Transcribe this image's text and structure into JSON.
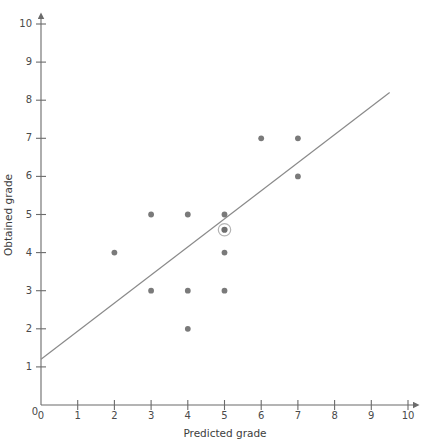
{
  "chart_data": {
    "type": "scatter",
    "title": "",
    "xlabel": "Predicted grade",
    "ylabel": "Obtained grade",
    "xlim": [
      0,
      10
    ],
    "ylim": [
      0,
      10
    ],
    "xticks": [
      0,
      1,
      2,
      3,
      4,
      5,
      6,
      7,
      8,
      9,
      10
    ],
    "yticks": [
      0,
      1,
      2,
      3,
      4,
      5,
      6,
      7,
      8,
      9,
      10
    ],
    "xtick_labels": [
      "0",
      "1",
      "2",
      "3",
      "4",
      "5",
      "6",
      "7",
      "8",
      "9",
      "10"
    ],
    "ytick_labels": [
      "0",
      "1",
      "2",
      "3",
      "4",
      "5",
      "6",
      "7",
      "8",
      "9",
      "10"
    ],
    "grid": false,
    "legend": null,
    "points": [
      {
        "x": 2,
        "y": 4
      },
      {
        "x": 3,
        "y": 5
      },
      {
        "x": 3,
        "y": 3
      },
      {
        "x": 4,
        "y": 5
      },
      {
        "x": 4,
        "y": 3
      },
      {
        "x": 4,
        "y": 2
      },
      {
        "x": 5,
        "y": 5
      },
      {
        "x": 5,
        "y": 4
      },
      {
        "x": 5,
        "y": 3
      },
      {
        "x": 6,
        "y": 7
      },
      {
        "x": 7,
        "y": 7
      },
      {
        "x": 7,
        "y": 6
      }
    ],
    "highlighted_point": {
      "x": 5,
      "y": 4.6,
      "marker": "circled-mean-point"
    },
    "trend_line": {
      "type": "line",
      "x_start": 0,
      "y_start": 1.2,
      "x_end": 9.5,
      "y_end": 8.2,
      "slope": 0.737,
      "intercept": 1.2
    },
    "colors": {
      "point": "#7a7a7a",
      "line": "#8a8a8a",
      "axis": "#6b6b6b",
      "text": "#3d3d3d"
    }
  },
  "axes": {
    "x_title": "Predicted grade",
    "y_title": "Obtained grade"
  }
}
